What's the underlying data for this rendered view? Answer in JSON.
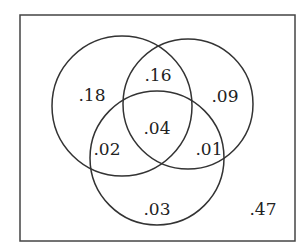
{
  "diagram": {
    "type": "venn-3-set",
    "universe": {
      "x": 20,
      "y": 15,
      "w": 275,
      "h": 226,
      "stroke": "#444444"
    },
    "circles": [
      {
        "name": "set-A",
        "cx": 122,
        "cy": 106,
        "r": 70
      },
      {
        "name": "set-B",
        "cx": 188,
        "cy": 104,
        "r": 65
      },
      {
        "name": "set-C",
        "cx": 157,
        "cy": 158,
        "r": 67
      }
    ],
    "stroke_color": "#333333",
    "regions": [
      {
        "name": "only-A",
        "value": ".18",
        "x": 92,
        "y": 96
      },
      {
        "name": "A-and-B-only",
        "value": ".16",
        "x": 158,
        "y": 76
      },
      {
        "name": "only-B",
        "value": ".09",
        "x": 225,
        "y": 97
      },
      {
        "name": "A-B-C",
        "value": ".04",
        "x": 157,
        "y": 129
      },
      {
        "name": "A-and-C-only",
        "value": ".02",
        "x": 107,
        "y": 150
      },
      {
        "name": "B-and-C-only",
        "value": ".01",
        "x": 209,
        "y": 150
      },
      {
        "name": "only-C",
        "value": ".03",
        "x": 157,
        "y": 210
      },
      {
        "name": "outside",
        "value": ".47",
        "x": 263,
        "y": 210
      }
    ]
  }
}
